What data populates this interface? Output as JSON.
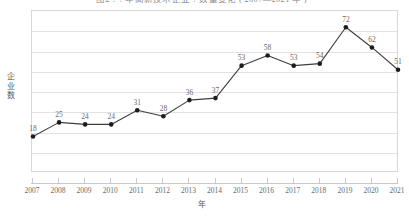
{
  "chart_data": {
    "type": "line",
    "title": "图2 ? ? 年高新技术企业 ? 数量变化 ( 2007—2021 年 )",
    "xlabel": "年",
    "ylabel": "企业数",
    "categories": [
      "2007",
      "2008",
      "2009",
      "2010",
      "2011",
      "2012",
      "2013",
      "2014",
      "2015",
      "2016",
      "2017",
      "2018",
      "2019",
      "2020",
      "2021"
    ],
    "values": [
      18,
      25,
      24,
      24,
      31,
      28,
      36,
      37,
      53,
      58,
      53,
      54,
      72,
      62,
      51
    ],
    "series": [
      {
        "name": "企业数",
        "values": [
          18,
          25,
          24,
          24,
          31,
          28,
          36,
          37,
          53,
          58,
          53,
          54,
          72,
          62,
          51
        ]
      }
    ],
    "data_labels": [
      "18",
      "25",
      "24",
      "24",
      "31",
      "28",
      "36",
      "37",
      "53",
      "58",
      "53",
      "54",
      "72",
      "62",
      "51"
    ],
    "ylim": [
      0,
      80
    ],
    "y_gridline_values": [
      0,
      10,
      20,
      30,
      40,
      50,
      60,
      70,
      80
    ],
    "y_tick_labels_visible": false,
    "grid": true,
    "legend": "none",
    "line_color": "#3f3f3f",
    "marker_color": "#1c1c1c",
    "marker_shape": "circle",
    "grid_color": "#e2e2e2",
    "axis_color": "#c9c9c9",
    "label_color": "#6a6a6a",
    "background": "#ffffff"
  }
}
